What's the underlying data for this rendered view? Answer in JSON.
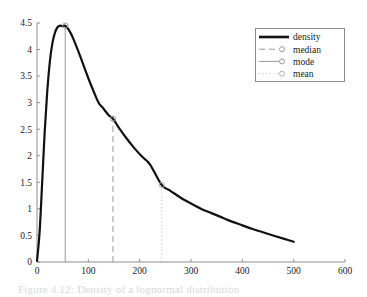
{
  "figure": {
    "caption": "Figure 4.12: Density of a lognormal distribution"
  },
  "legend": {
    "position": "top-right",
    "entries": [
      {
        "label": "density",
        "style": "solid-thick",
        "color": "#111111",
        "marker": "none"
      },
      {
        "label": "median",
        "style": "dashed",
        "color": "#9a9a9a",
        "marker": "circle"
      },
      {
        "label": "mode",
        "style": "solid",
        "color": "#9a9a9a",
        "marker": "circle"
      },
      {
        "label": "mean",
        "style": "dotted",
        "color": "#b4b4b4",
        "marker": "circle"
      }
    ]
  },
  "axes": {
    "x_ticks": [
      "0",
      "100",
      "200",
      "300",
      "400",
      "500",
      "600"
    ],
    "y_ticks": [
      "0",
      "0.5",
      "1",
      "1.5",
      "2",
      "2.5",
      "3",
      "3.5",
      "4",
      "4.5"
    ]
  },
  "chart_data": {
    "type": "line",
    "title": "",
    "xlabel": "",
    "ylabel": "",
    "xlim": [
      0,
      600
    ],
    "ylim": [
      0,
      4.5
    ],
    "grid": false,
    "legend_position": "top-right",
    "x_ticks": [
      0,
      100,
      200,
      300,
      400,
      500,
      600
    ],
    "y_ticks": [
      0,
      0.5,
      1,
      1.5,
      2,
      2.5,
      3,
      3.5,
      4,
      4.5
    ],
    "series": [
      {
        "name": "density",
        "type": "line",
        "color": "#111111",
        "linewidth": 2.2,
        "linestyle": "solid",
        "x": [
          0,
          5,
          10,
          15,
          20,
          25,
          30,
          35,
          40,
          45,
          50,
          55,
          60,
          65,
          70,
          80,
          90,
          100,
          110,
          120,
          130,
          140,
          148,
          160,
          175,
          190,
          205,
          220,
          243,
          260,
          280,
          300,
          320,
          340,
          360,
          380,
          400,
          420,
          440,
          460,
          480,
          500
        ],
        "y": [
          0.02,
          0.55,
          1.48,
          2.45,
          3.22,
          3.77,
          4.12,
          4.32,
          4.42,
          4.45,
          4.44,
          4.45,
          4.4,
          4.32,
          4.22,
          3.98,
          3.72,
          3.46,
          3.22,
          3.0,
          2.88,
          2.76,
          2.7,
          2.52,
          2.32,
          2.14,
          1.98,
          1.84,
          1.45,
          1.34,
          1.21,
          1.1,
          1.0,
          0.92,
          0.84,
          0.76,
          0.69,
          0.62,
          0.56,
          0.5,
          0.44,
          0.38
        ]
      }
    ],
    "vertical_markers": [
      {
        "name": "mode",
        "x": 55,
        "y": 4.45,
        "label": "mode",
        "linestyle": "solid",
        "color": "#9a9a9a"
      },
      {
        "name": "median",
        "x": 148,
        "y": 2.7,
        "label": "median",
        "linestyle": "dashed",
        "color": "#9a9a9a"
      },
      {
        "name": "mean",
        "x": 243,
        "y": 1.45,
        "label": "mean",
        "linestyle": "dotted",
        "color": "#b4b4b4"
      }
    ]
  }
}
